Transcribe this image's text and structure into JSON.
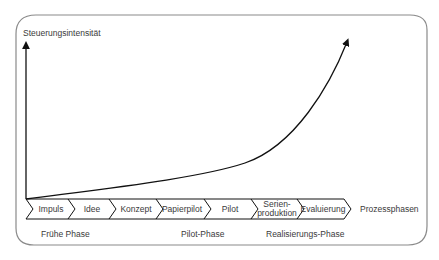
{
  "diagram": {
    "y_axis_label": "Steuerungsintensität",
    "x_axis_label": "Prozessphasen",
    "curve_description": "exponentially increasing control intensity across process phases",
    "process_steps": [
      {
        "label": "Impuls"
      },
      {
        "label": "Idee"
      },
      {
        "label": "Konzept"
      },
      {
        "label": "Papierpilot"
      },
      {
        "label": "Pilot"
      },
      {
        "label": "Serien-",
        "label2": "produktion"
      },
      {
        "label": "Evaluierung"
      }
    ],
    "phase_groups": [
      {
        "label": "Frühe Phase"
      },
      {
        "label": "Pilot-Phase"
      },
      {
        "label": "Realisierungs-Phase"
      }
    ],
    "colors": {
      "frame": "#8a8a8a",
      "lines": "#1a1a1a",
      "text": "#3a3a3a"
    }
  }
}
